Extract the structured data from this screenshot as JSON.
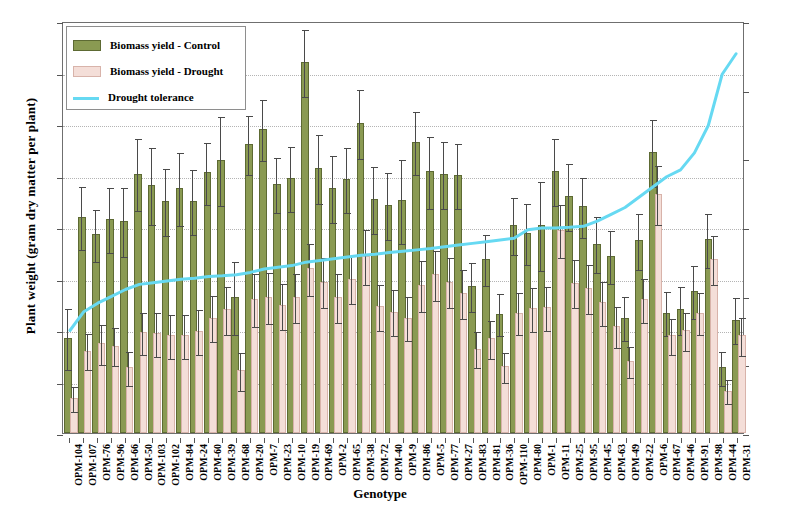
{
  "chart_data": {
    "type": "bar",
    "title": "",
    "xlabel": "Genotype",
    "ylabel": "Plant weight (gram dry matter  per plant)",
    "y2label": "Drought tolerance (%)",
    "ylim": [
      0,
      40
    ],
    "yticks": [
      0,
      5,
      10,
      15,
      20,
      25,
      30,
      35,
      40
    ],
    "y2lim": [
      0,
      120
    ],
    "y2ticks": [
      0,
      20,
      40,
      60,
      80,
      100,
      120
    ],
    "grid": true,
    "legend_position": "top-left",
    "legend": [
      {
        "label": "Biomass yield - Control",
        "color": "#8a9a52",
        "marker": "bar"
      },
      {
        "label": "Biomass yield - Drought",
        "color": "#f4ded8",
        "marker": "bar"
      },
      {
        "label": "Drought tolerance",
        "color": "#66d9f2",
        "marker": "line"
      }
    ],
    "categories": [
      "OPM-104",
      "OPM-107",
      "OPM-76",
      "OPM-96",
      "OPM-66",
      "OPM-50",
      "OPM-103",
      "OPM-102",
      "OPM-84",
      "OPM-24",
      "OPM-60",
      "OPM-39",
      "OPM-68",
      "OPM-20",
      "OPM-7",
      "OPM-23",
      "OPM-10",
      "OPM-19",
      "OPM-69",
      "OPM-2",
      "OPM-65",
      "OPM-38",
      "OPM-72",
      "OPM-40",
      "OPM-9",
      "OPM-86",
      "OPM-5",
      "OPM-77",
      "OPM-27",
      "OPM-83",
      "OPM-81",
      "OPM-36",
      "OPM-110",
      "OPM-80",
      "OPM-1",
      "OPM-11",
      "OPM-25",
      "OPM-95",
      "OPM-45",
      "OPM-63",
      "OPM-49",
      "OPM-22",
      "OPM-6",
      "OPM-67",
      "OPM-46",
      "OPM-91",
      "OPM-98",
      "OPM-44",
      "OPM-31"
    ],
    "series": [
      {
        "name": "Biomass yield - Control",
        "axis": "left",
        "color": "#8a9a52",
        "values": [
          9.0,
          20.8,
          19.1,
          20.6,
          20.4,
          25.0,
          23.9,
          22.3,
          23.6,
          22.3,
          25.1,
          26.3,
          13.0,
          27.9,
          29.3,
          24.0,
          24.6,
          35.8,
          25.5,
          23.6,
          24.5,
          29.9,
          22.5,
          21.9,
          22.4,
          28.1,
          25.2,
          25.0,
          24.9,
          14.1,
          16.7,
          11.4,
          20.0,
          19.2,
          20.0,
          25.2,
          22.8,
          21.8,
          18.2,
          17.0,
          11.0,
          18.5,
          27.1,
          11.5,
          11.8,
          13.6,
          18.6,
          6.2,
          10.8
        ],
        "errors": [
          3.0,
          3.1,
          2.6,
          3.2,
          3.4,
          3.5,
          3.8,
          3.3,
          3.6,
          3.2,
          3.1,
          4.4,
          3.6,
          2.9,
          3.0,
          2.7,
          3.2,
          3.3,
          3.4,
          3.3,
          3.2,
          3.4,
          3.3,
          3.3,
          4.1,
          3.1,
          3.5,
          3.3,
          3.2,
          2.4,
          2.5,
          2.1,
          2.8,
          3.0,
          4.4,
          3.3,
          3.3,
          3.0,
          2.8,
          2.6,
          2.2,
          2.8,
          3.3,
          2.2,
          2.4,
          2.6,
          2.7,
          1.7,
          2.3
        ]
      },
      {
        "name": "Biomass yield - Drought",
        "axis": "left",
        "color": "#f4ded8",
        "values": [
          3.2,
          7.8,
          8.5,
          8.3,
          6.2,
          9.6,
          9.5,
          9.3,
          9.3,
          9.7,
          11.0,
          11.8,
          5.9,
          12.8,
          13.0,
          12.2,
          13.0,
          15.8,
          14.5,
          13.0,
          14.8,
          17.0,
          12.1,
          11.6,
          11.0,
          14.2,
          15.2,
          14.5,
          13.4,
          8.0,
          9.0,
          6.3,
          11.5,
          11.9,
          12.0,
          19.5,
          14.4,
          13.9,
          12.5,
          10.2,
          6.8,
          12.8,
          23.0,
          9.3,
          9.8,
          11.5,
          16.7,
          3.9,
          9.3
        ],
        "errors": [
          1.3,
          1.8,
          2.0,
          1.9,
          1.7,
          2.1,
          2.2,
          2.2,
          2.2,
          2.2,
          2.3,
          2.4,
          1.9,
          2.6,
          2.5,
          2.3,
          2.4,
          2.6,
          2.5,
          2.4,
          2.4,
          2.7,
          2.3,
          2.3,
          2.2,
          2.5,
          2.5,
          2.5,
          2.4,
          1.8,
          1.9,
          1.5,
          2.1,
          2.2,
          2.2,
          2.6,
          2.4,
          2.4,
          2.2,
          2.0,
          1.6,
          2.2,
          2.9,
          1.8,
          1.9,
          2.1,
          2.4,
          1.2,
          1.9
        ]
      },
      {
        "name": "Drought tolerance",
        "axis": "right",
        "color": "#66d9f2",
        "values": [
          30.0,
          35.5,
          38.0,
          40.0,
          42.0,
          43.5,
          44.0,
          44.5,
          45.0,
          45.3,
          45.8,
          46.0,
          46.3,
          47.0,
          48.0,
          48.5,
          49.0,
          50.0,
          50.5,
          51.0,
          51.5,
          52.0,
          52.3,
          52.8,
          53.2,
          53.6,
          54.0,
          54.5,
          55.0,
          55.5,
          56.0,
          56.5,
          57.0,
          59.5,
          60.0,
          60.0,
          60.2,
          60.5,
          62.0,
          64.0,
          66.0,
          69.0,
          72.0,
          75.0,
          77.0,
          82.0,
          90.0,
          105.0,
          111.0
        ]
      }
    ]
  }
}
